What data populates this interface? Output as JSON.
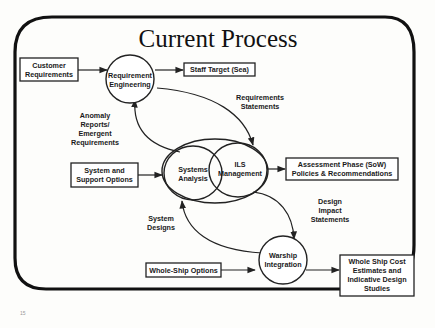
{
  "title": "Current Process",
  "page_number": "15",
  "colors": {
    "ink": "#222222",
    "background": "#fdfdfb"
  },
  "nodes": {
    "requirement_engineering": {
      "line1": "Requirement",
      "line2": "Engineering"
    },
    "systems_analysis": {
      "line1": "Systems",
      "line2": "Analysis"
    },
    "ils_management": {
      "line1": "ILS",
      "line2": "Management"
    },
    "warship_integration": {
      "line1": "Warship",
      "line2": "Integration"
    }
  },
  "boxes": {
    "customer_requirements": {
      "line1": "Customer",
      "line2": "Requirements"
    },
    "staff_target": {
      "line1": "Staff Target (Sea)"
    },
    "system_support_options": {
      "line1": "System and",
      "line2": "Support Options"
    },
    "assessment_phase": {
      "line1": "Assessment Phase (SoW)",
      "line2": "Policies & Recommendations"
    },
    "whole_ship_options": {
      "line1": "Whole-Ship Options"
    },
    "whole_ship_cost": {
      "line1": "Whole Ship Cost",
      "line2": "Estimates and",
      "line3": "Indicative Design",
      "line4": "Studies"
    }
  },
  "edge_labels": {
    "requirements_statements": {
      "line1": "Requirements",
      "line2": "Statements"
    },
    "anomaly_reports": {
      "line1": "Anomaly",
      "line2": "Reports/",
      "line3": "Emergent",
      "line4": "Requirements"
    },
    "design_impact": {
      "line1": "Design",
      "line2": "Impact",
      "line3": "Statements"
    },
    "system_designs": {
      "line1": "System",
      "line2": "Designs"
    }
  }
}
